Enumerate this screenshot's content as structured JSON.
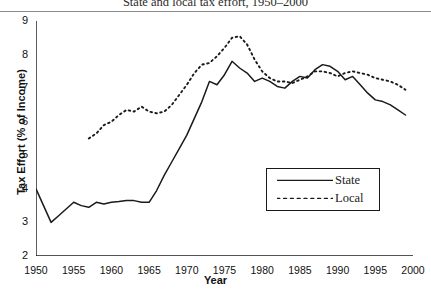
{
  "chart_data": {
    "type": "line",
    "title": "State and local tax effort, 1950–2000",
    "xlabel": "Year",
    "ylabel": "Tax Effort (% of Income)",
    "xlim": [
      1950,
      2000
    ],
    "ylim": [
      2,
      9
    ],
    "ytick_labels": [
      "2",
      "3",
      "4",
      "5",
      "6",
      "7",
      "8",
      "9"
    ],
    "ytick_values": [
      2,
      3,
      4,
      5,
      6,
      7,
      8,
      9
    ],
    "xtick_labels": [
      "1950",
      "1955",
      "1960",
      "1965",
      "1970",
      "1975",
      "1980",
      "1985",
      "1990",
      "1995",
      "2000"
    ],
    "xtick_values": [
      1950,
      1955,
      1960,
      1965,
      1970,
      1975,
      1980,
      1985,
      1990,
      1995,
      2000
    ],
    "minor_tick_interval": 1,
    "grid": false,
    "legend_position": "center-right",
    "series": [
      {
        "name": "State",
        "style": "solid",
        "color": "#1a1a1a",
        "x": [
          1950,
          1951,
          1952,
          1953,
          1954,
          1955,
          1956,
          1957,
          1958,
          1959,
          1960,
          1961,
          1962,
          1963,
          1964,
          1965,
          1966,
          1967,
          1968,
          1969,
          1970,
          1971,
          1972,
          1973,
          1974,
          1975,
          1976,
          1977,
          1978,
          1979,
          1980,
          1981,
          1982,
          1983,
          1984,
          1985,
          1986,
          1987,
          1988,
          1989,
          1990,
          1991,
          1992,
          1993,
          1994,
          1995,
          1996,
          1997,
          1998,
          1999
        ],
        "values": [
          4.0,
          3.5,
          3.0,
          3.2,
          3.4,
          3.6,
          3.5,
          3.45,
          3.6,
          3.55,
          3.6,
          3.62,
          3.65,
          3.65,
          3.6,
          3.6,
          3.95,
          4.4,
          4.8,
          5.2,
          5.6,
          6.1,
          6.6,
          7.2,
          7.1,
          7.4,
          7.8,
          7.6,
          7.45,
          7.2,
          7.3,
          7.2,
          7.05,
          7.0,
          7.2,
          7.35,
          7.3,
          7.55,
          7.7,
          7.65,
          7.5,
          7.25,
          7.35,
          7.1,
          6.85,
          6.65,
          6.6,
          6.5,
          6.35,
          6.2
        ]
      },
      {
        "name": "Local",
        "style": "dotted",
        "color": "#1a1a1a",
        "x": [
          1957,
          1958,
          1959,
          1960,
          1961,
          1962,
          1963,
          1964,
          1965,
          1966,
          1967,
          1968,
          1969,
          1970,
          1971,
          1972,
          1973,
          1974,
          1975,
          1976,
          1977,
          1978,
          1979,
          1980,
          1981,
          1982,
          1983,
          1984,
          1985,
          1986,
          1987,
          1988,
          1989,
          1990,
          1991,
          1992,
          1993,
          1994,
          1995,
          1996,
          1997,
          1998,
          1999
        ],
        "values": [
          5.5,
          5.65,
          5.9,
          6.0,
          6.2,
          6.35,
          6.3,
          6.45,
          6.3,
          6.25,
          6.3,
          6.5,
          6.8,
          7.1,
          7.45,
          7.7,
          7.75,
          7.95,
          8.2,
          8.5,
          8.55,
          8.3,
          7.85,
          7.5,
          7.3,
          7.2,
          7.2,
          7.15,
          7.25,
          7.35,
          7.5,
          7.5,
          7.45,
          7.35,
          7.45,
          7.5,
          7.45,
          7.4,
          7.3,
          7.25,
          7.2,
          7.1,
          6.95
        ]
      }
    ],
    "legend": [
      {
        "label": "State",
        "style": "solid"
      },
      {
        "label": "Local",
        "style": "dotted"
      }
    ]
  }
}
